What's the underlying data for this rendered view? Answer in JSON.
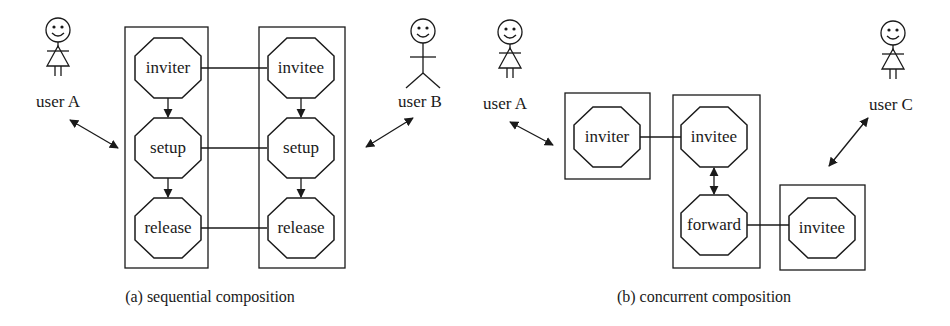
{
  "figure_a": {
    "caption": "(a) sequential composition",
    "users": [
      {
        "label": "user A",
        "figure": "female"
      },
      {
        "label": "user B",
        "figure": "male"
      }
    ],
    "columns": [
      {
        "nodes": [
          "inviter",
          "setup",
          "release"
        ]
      },
      {
        "nodes": [
          "invitee",
          "setup",
          "release"
        ]
      }
    ]
  },
  "figure_b": {
    "caption": "(b) concurrent composition",
    "users": [
      {
        "label": "user A",
        "figure": "female"
      },
      {
        "label": "user C",
        "figure": "female"
      }
    ],
    "boxes": [
      {
        "nodes": [
          "inviter"
        ]
      },
      {
        "nodes": [
          "invitee",
          "forward"
        ]
      },
      {
        "nodes": [
          "invitee"
        ]
      }
    ]
  },
  "colors": {
    "ink": "#1a1a1a",
    "background": "#ffffff"
  }
}
